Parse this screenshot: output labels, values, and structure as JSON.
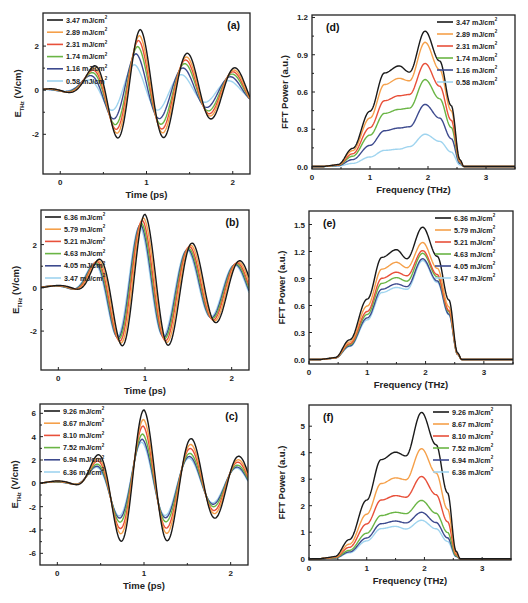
{
  "colors": [
    "#1a1a1a",
    "#f5a04a",
    "#e8503a",
    "#6ab545",
    "#3d4a8e",
    "#9fd4ef"
  ],
  "chart_data": [
    {
      "id": "a",
      "type": "line",
      "panel_label": "(a)",
      "xlabel": "Time (ps)",
      "ylabel_main": "E",
      "ylabel_sub": "THz",
      "ylabel_rest": " (V/cm)",
      "xlim": [
        -0.2,
        2.2
      ],
      "ylim": [
        -3.8,
        3.5
      ],
      "xticks": [
        0,
        1,
        2
      ],
      "yticks": [
        -2,
        0,
        2
      ],
      "legend_position": "top-left",
      "waveform": {
        "t0": 0.93,
        "neg_t": 0.6,
        "peak_scale": 2.75
      },
      "series": [
        {
          "name": "3.47 mJ/cm",
          "sup": "2",
          "amplitude": 1.0,
          "shift": 0.0
        },
        {
          "name": "2.89 mJ/cm",
          "sup": "2",
          "amplitude": 0.9,
          "shift": -0.01
        },
        {
          "name": "2.31 mJ/cm",
          "sup": "2",
          "amplitude": 0.82,
          "shift": -0.02
        },
        {
          "name": "1.74 mJ/cm",
          "sup": "2",
          "amplitude": 0.72,
          "shift": -0.03
        },
        {
          "name": "1.16 mJ/cm",
          "sup": "2",
          "amplitude": 0.6,
          "shift": -0.05
        },
        {
          "name": "0.58 mJ/cm",
          "sup": "2",
          "amplitude": 0.42,
          "shift": -0.07
        }
      ]
    },
    {
      "id": "d",
      "type": "line",
      "panel_label": "(d)",
      "xlabel": "Frequency (THz)",
      "ylabel_main": "FFT Power (a.u.)",
      "xlim": [
        0,
        3.5
      ],
      "ylim": [
        -0.02,
        1.22
      ],
      "xticks": [
        0,
        1,
        2,
        3
      ],
      "yticks": [
        0.0,
        0.3,
        0.6,
        0.9,
        1.2
      ],
      "ytick_decimals": 1,
      "legend_position": "top-right",
      "series": [
        {
          "name": "3.47 mJ/cm",
          "sup": "2",
          "peak_low": 0.81,
          "dip": 0.76,
          "peak_high": 1.09
        },
        {
          "name": "2.89 mJ/cm",
          "sup": "2",
          "peak_low": 0.71,
          "dip": 0.69,
          "peak_high": 1.0
        },
        {
          "name": "2.31 mJ/cm",
          "sup": "2",
          "peak_low": 0.57,
          "dip": 0.58,
          "peak_high": 0.83
        },
        {
          "name": "1.74 mJ/cm",
          "sup": "2",
          "peak_low": 0.46,
          "dip": 0.47,
          "peak_high": 0.7
        },
        {
          "name": "1.16 mJ/cm",
          "sup": "2",
          "peak_low": 0.31,
          "dip": 0.32,
          "peak_high": 0.5
        },
        {
          "name": "0.58 mJ/cm",
          "sup": "2",
          "peak_low": 0.14,
          "dip": 0.16,
          "peak_high": 0.26
        }
      ]
    },
    {
      "id": "b",
      "type": "line",
      "panel_label": "(b)",
      "xlabel": "Time (ps)",
      "ylabel_main": "E",
      "ylabel_sub": "THz",
      "ylabel_rest": " (V/cm)",
      "xlim": [
        -0.2,
        2.2
      ],
      "ylim": [
        -3.8,
        3.6
      ],
      "xticks": [
        0,
        1,
        2
      ],
      "yticks": [
        -2,
        0,
        2
      ],
      "legend_position": "top-left",
      "waveform": {
        "t0": 1.0,
        "neg_t": 0.65,
        "peak_scale": 3.4
      },
      "series": [
        {
          "name": "6.36 mJ/cm",
          "sup": "2",
          "amplitude": 1.0,
          "shift": 0.0
        },
        {
          "name": "5.79 mJ/cm",
          "sup": "2",
          "amplitude": 0.95,
          "shift": -0.015
        },
        {
          "name": "5.21 mJ/cm",
          "sup": "2",
          "amplitude": 0.92,
          "shift": -0.03
        },
        {
          "name": "4.63 mJ/cm",
          "sup": "2",
          "amplitude": 0.88,
          "shift": -0.04
        },
        {
          "name": "4.05 mJ/cm",
          "sup": "2",
          "amplitude": 0.86,
          "shift": -0.05
        },
        {
          "name": "3.47 mJ/cm",
          "sup": "2",
          "amplitude": 0.84,
          "shift": -0.06
        }
      ]
    },
    {
      "id": "e",
      "type": "line",
      "panel_label": "(e)",
      "xlabel": "Frequency (THz)",
      "ylabel_main": "FFT Power (a.u.)",
      "xlim": [
        0,
        3.5
      ],
      "ylim": [
        -0.05,
        1.65
      ],
      "xticks": [
        0,
        1,
        2,
        3
      ],
      "yticks": [
        0.0,
        0.3,
        0.6,
        0.9,
        1.2,
        1.5
      ],
      "ytick_decimals": 1,
      "legend_position": "top-right",
      "series": [
        {
          "name": "6.36 mJ/cm",
          "sup": "2",
          "peak_low": 1.22,
          "dip": 1.12,
          "peak_high": 1.47
        },
        {
          "name": "5.79 mJ/cm",
          "sup": "2",
          "peak_low": 1.08,
          "dip": 1.02,
          "peak_high": 1.3
        },
        {
          "name": "5.21 mJ/cm",
          "sup": "2",
          "peak_low": 0.97,
          "dip": 0.93,
          "peak_high": 1.21
        },
        {
          "name": "4.63 mJ/cm",
          "sup": "2",
          "peak_low": 0.91,
          "dip": 0.87,
          "peak_high": 1.18
        },
        {
          "name": "4.05 mJ/cm",
          "sup": "2",
          "peak_low": 0.84,
          "dip": 0.81,
          "peak_high": 1.12
        },
        {
          "name": "3.47 mJ/cm",
          "sup": "2",
          "peak_low": 0.8,
          "dip": 0.78,
          "peak_high": 1.1
        }
      ]
    },
    {
      "id": "c",
      "type": "line",
      "panel_label": "(c)",
      "xlabel": "Time (ps)",
      "ylabel_main": "E",
      "ylabel_sub": "THz",
      "ylabel_rest": " (V/cm)",
      "xlim": [
        -0.2,
        2.2
      ],
      "ylim": [
        -7,
        6.8
      ],
      "xticks": [
        0,
        1,
        2
      ],
      "yticks": [
        -6,
        -4,
        -2,
        0,
        2,
        4,
        6
      ],
      "legend_position": "top-left",
      "waveform": {
        "t0": 1.0,
        "neg_t": 0.65,
        "peak_scale": 6.3
      },
      "series": [
        {
          "name": "9.26 mJ/cm",
          "sup": "2",
          "amplitude": 1.0,
          "shift": 0.0
        },
        {
          "name": "8.67 mJ/cm",
          "sup": "2",
          "amplitude": 0.87,
          "shift": -0.005
        },
        {
          "name": "8.10 mJ/cm",
          "sup": "2",
          "amplitude": 0.78,
          "shift": -0.01
        },
        {
          "name": "7.52 mJ/cm",
          "sup": "2",
          "amplitude": 0.67,
          "shift": -0.015
        },
        {
          "name": "6.94 mJ/cm",
          "sup": "2",
          "amplitude": 0.6,
          "shift": -0.02
        },
        {
          "name": "6.36 mJ/cm",
          "sup": "2",
          "amplitude": 0.56,
          "shift": -0.025
        }
      ]
    },
    {
      "id": "f",
      "type": "line",
      "panel_label": "(f)",
      "xlabel": "Frequency (THz)",
      "ylabel_main": "FFT Power (a.u.)",
      "xlim": [
        0,
        3.5
      ],
      "ylim": [
        -0.05,
        5.8
      ],
      "xticks": [
        0,
        1,
        2,
        3
      ],
      "yticks": [
        0,
        1,
        2,
        3,
        4,
        5
      ],
      "ytick_decimals": 0,
      "legend_position": "top-right",
      "series": [
        {
          "name": "9.26 mJ/cm",
          "sup": "2",
          "peak_low": 4.02,
          "dip": 3.88,
          "peak_high": 5.52
        },
        {
          "name": "8.67 mJ/cm",
          "sup": "2",
          "peak_low": 3.05,
          "dip": 2.98,
          "peak_high": 4.15
        },
        {
          "name": "8.10 mJ/cm",
          "sup": "2",
          "peak_low": 2.38,
          "dip": 2.32,
          "peak_high": 3.1
        },
        {
          "name": "7.52 mJ/cm",
          "sup": "2",
          "peak_low": 1.75,
          "dip": 1.7,
          "peak_high": 2.2
        },
        {
          "name": "6.94 mJ/cm",
          "sup": "2",
          "peak_low": 1.42,
          "dip": 1.35,
          "peak_high": 1.75
        },
        {
          "name": "6.36 mJ/cm",
          "sup": "2",
          "peak_low": 1.22,
          "dip": 1.12,
          "peak_high": 1.45
        }
      ]
    }
  ]
}
